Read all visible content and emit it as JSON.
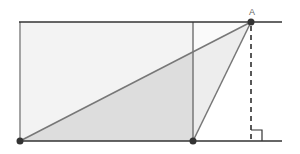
{
  "diagram": {
    "type": "geometry",
    "labels": {
      "point_a": "A"
    },
    "colors": {
      "line": "#555555",
      "parallel_line": "#333333",
      "rect_fill": "#f2f2f2",
      "triangle_fill": "#d9d9d9",
      "point": "#333333",
      "dashed": "#222222"
    },
    "points": {
      "bottom_left": [
        20,
        141
      ],
      "bottom_middle": [
        193,
        141
      ],
      "A": [
        251,
        22
      ]
    }
  }
}
